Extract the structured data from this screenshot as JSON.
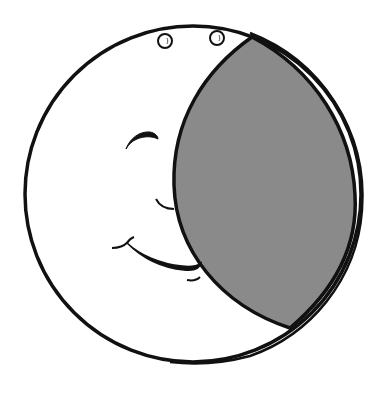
{
  "illustration": {
    "title": "Smiling crescent moon face",
    "colors": {
      "background": "#ffffff",
      "line": "#111111",
      "shadow_fill": "#8a8a8a"
    },
    "outer_circle": {
      "cx": 193,
      "cy": 194,
      "r": 168
    },
    "rim_offset_circle": {
      "cx": 198,
      "cy": 196,
      "r": 166
    },
    "shadow_lens": {
      "top_tip": [
        252,
        37
      ],
      "bottom_tip": [
        290,
        328
      ],
      "left_extreme": [
        174,
        180
      ],
      "right_extreme": [
        355,
        200
      ]
    },
    "top_holes": [
      {
        "cx": 165,
        "cy": 41,
        "r": 7
      },
      {
        "cx": 217,
        "cy": 38,
        "r": 7
      }
    ],
    "face": {
      "eye": "closed-crescent",
      "nose": "curve",
      "mouth": "smile",
      "chin": "small-mark"
    }
  }
}
